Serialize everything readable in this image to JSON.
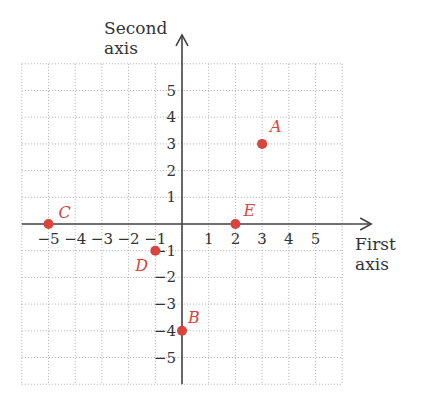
{
  "chart_data": {
    "type": "scatter",
    "title": "",
    "xlabel": "First axis",
    "ylabel": "Second axis",
    "xlim": [
      -6,
      6
    ],
    "ylim": [
      -6,
      6
    ],
    "grid": true,
    "x_ticks": [
      -5,
      -4,
      -3,
      -2,
      -1,
      1,
      2,
      3,
      4,
      5
    ],
    "y_ticks": [
      -5,
      -4,
      -3,
      -2,
      -1,
      1,
      2,
      3,
      4,
      5
    ],
    "points": [
      {
        "label": "A",
        "x": 3,
        "y": 3
      },
      {
        "label": "B",
        "x": 0,
        "y": -4
      },
      {
        "label": "C",
        "x": -5,
        "y": 0
      },
      {
        "label": "D",
        "x": -1,
        "y": -1
      },
      {
        "label": "E",
        "x": 2,
        "y": 0
      }
    ],
    "colors": {
      "point": "#d9453c",
      "axis": "#444444",
      "grid": "#bbbbbb"
    }
  },
  "axes": {
    "x_label_line1": "First",
    "x_label_line2": "axis",
    "y_label_line1": "Second",
    "y_label_line2": "axis"
  }
}
